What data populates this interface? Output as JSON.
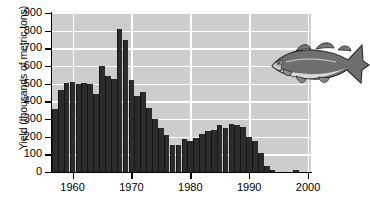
{
  "chart_data": {
    "type": "bar",
    "title": "",
    "xlabel": "",
    "ylabel": "Yield (thousands of metric tons)",
    "ylim": [
      0,
      900
    ],
    "xlim": [
      1956.5,
      2000.5
    ],
    "yticks": [
      0,
      100,
      200,
      300,
      400,
      500,
      600,
      700,
      800,
      900
    ],
    "ytick_labels": [
      "0",
      "100",
      "200",
      "300",
      "400",
      "500",
      "600",
      "700",
      "800",
      "900"
    ],
    "xticks": [
      1960,
      1970,
      1980,
      1990,
      2000
    ],
    "xtick_labels": [
      "1960",
      "1970",
      "1980",
      "1990",
      "2000"
    ],
    "grid": "white gridlines on gray panel, horizontal at every 100, vertical at every decade",
    "legend": "none",
    "background_color": "#cdcdcd",
    "bar_color": "#2c2c2c",
    "gridline_color": "#ffffff",
    "categories": [
      1957,
      1958,
      1959,
      1960,
      1961,
      1962,
      1963,
      1964,
      1965,
      1966,
      1967,
      1968,
      1969,
      1970,
      1971,
      1972,
      1973,
      1974,
      1975,
      1976,
      1977,
      1978,
      1979,
      1980,
      1981,
      1982,
      1983,
      1984,
      1985,
      1986,
      1987,
      1988,
      1989,
      1990,
      1991,
      1992,
      1993,
      1994,
      1995,
      1996,
      1997,
      1998,
      1999
    ],
    "values": [
      355,
      465,
      505,
      510,
      500,
      505,
      500,
      440,
      600,
      545,
      525,
      810,
      750,
      520,
      430,
      455,
      360,
      300,
      250,
      210,
      155,
      155,
      185,
      175,
      195,
      215,
      230,
      240,
      265,
      250,
      270,
      265,
      255,
      200,
      175,
      110,
      35,
      10,
      0,
      0,
      0,
      12,
      0
    ]
  },
  "annotations": {
    "fish_label": "atlantic-cod-illustration"
  }
}
